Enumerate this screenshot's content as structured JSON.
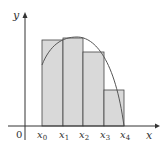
{
  "figure": {
    "type": "riemann-sum-diagram",
    "axis_labels": {
      "x": "x",
      "y": "y",
      "origin": "0"
    },
    "tick_labels": [
      {
        "base": "x",
        "sub": "0"
      },
      {
        "base": "x",
        "sub": "1"
      },
      {
        "base": "x",
        "sub": "2"
      },
      {
        "base": "x",
        "sub": "3"
      },
      {
        "base": "x",
        "sub": "4"
      }
    ],
    "colors": {
      "rect_fill": "#d9d9d9",
      "rect_stroke": "#444444",
      "axis": "#333333",
      "curve": "#555555"
    },
    "rectangles": [
      {
        "from": "x0",
        "to": "x1",
        "height_label": "f(x1)"
      },
      {
        "from": "x1",
        "to": "x2",
        "height_label": "max"
      },
      {
        "from": "x2",
        "to": "x3",
        "height_label": "f(x2)"
      },
      {
        "from": "x3",
        "to": "x4",
        "height_label": "f(x3)"
      }
    ]
  }
}
